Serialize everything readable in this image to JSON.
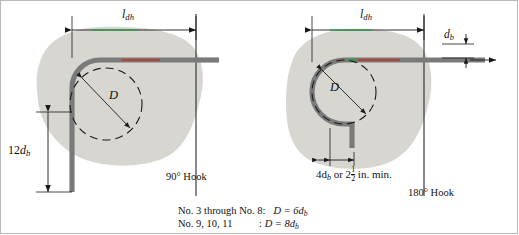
{
  "figure": {
    "panels": [
      {
        "id": "hook-90",
        "label": "90° Hook",
        "dim_top": "l",
        "dim_top_sub": "dh",
        "dim_left_value": "12",
        "dim_left_sub": "d",
        "dim_left_sub2": "b",
        "bend_diameter_symbol": "D"
      },
      {
        "id": "hook-180",
        "label": "180° Hook",
        "dim_top": "l",
        "dim_top_sub": "dh",
        "bar_dia_label": "d",
        "bar_dia_sub": "b",
        "tail_dim": "4d",
        "tail_dim_sub": "b",
        "tail_dim_or": " or 2",
        "tail_frac_num": "1",
        "tail_frac_den": "2",
        "tail_units": " in. min.",
        "bend_diameter_symbol": "D"
      }
    ],
    "notes": [
      {
        "bars": "No. 3 through No. 8:",
        "relation": "D  =  6d",
        "relation_sub": "b"
      },
      {
        "bars": "No. 9, 10, 11",
        "colon": ":",
        "relation": "D  =  8d",
        "relation_sub": "b"
      }
    ],
    "colors": {
      "bar": "#7a7a7a",
      "bar_highlight_green": "#2f9e4f",
      "bar_highlight_red": "#c0392b",
      "concrete_shade": "#d6d4cd",
      "dimension_line": "#1a1a1a",
      "dashed_circle": "#1a1a1a",
      "frame": "#b8b8b8"
    }
  }
}
